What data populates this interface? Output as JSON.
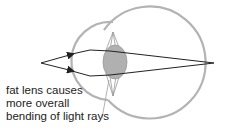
{
  "diagram": {
    "caption_lines": [
      "fat lens causes",
      "more overall",
      "bending of light rays"
    ],
    "colors": {
      "eye_outline": "#b3b3b3",
      "lens_fill": "#b0b0b0",
      "lens_outline": "#9a9a9a",
      "ray": "#222222",
      "text": "#222222",
      "pointer": "#a0a0a0"
    },
    "elements": {
      "eyeball": {
        "cx": 162,
        "cy": 64,
        "r": 56
      },
      "cornea": {
        "cx": 128,
        "cy": 66,
        "r": 36
      },
      "lens": {
        "cx": 115,
        "cy": 62,
        "rx": 12,
        "ry": 17
      },
      "ray_source": {
        "x": 41,
        "y": 63
      },
      "focal_point": {
        "x": 214,
        "y": 63
      }
    }
  }
}
